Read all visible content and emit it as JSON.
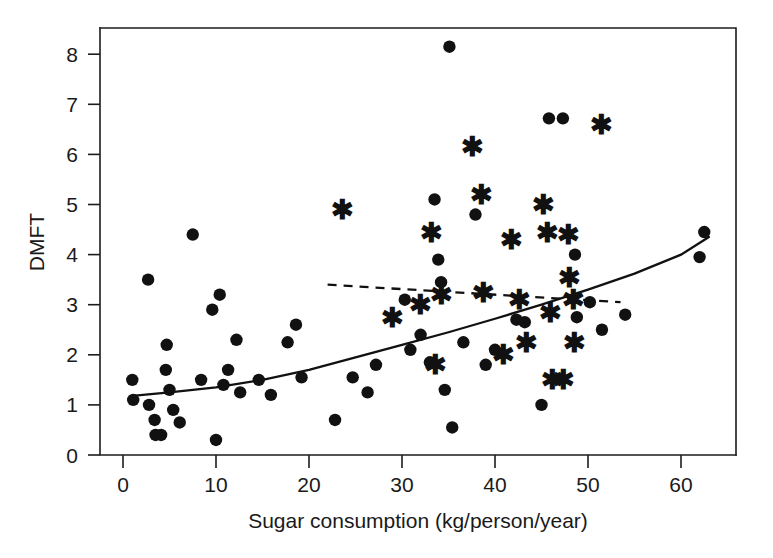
{
  "figure": {
    "title": "",
    "background_color": "#ffffff",
    "marker_color": "#111111",
    "axis_color": "#1c1c1c"
  },
  "chart_data": {
    "type": "scatter",
    "title": "",
    "subtitle": "",
    "xlabel": "Sugar consumption (kg/person/year)",
    "ylabel": "DMFT",
    "xlim": [
      -1.5,
      68
    ],
    "ylim": [
      -0.25,
      8.6
    ],
    "xticks": [
      0,
      10,
      20,
      30,
      40,
      50,
      60
    ],
    "xtick_labels": [
      "0",
      "10",
      "20",
      "30",
      "40",
      "50",
      "60"
    ],
    "yticks": [
      0,
      1,
      2,
      3,
      4,
      5,
      6,
      7,
      8
    ],
    "ytick_labels": [
      "0",
      "1",
      "2",
      "3",
      "4",
      "5",
      "6",
      "7",
      "8"
    ],
    "grid": false,
    "legend": null,
    "legend_position": "none",
    "series": [
      {
        "name": "circle-markers",
        "marker": "circle",
        "color": "#111111",
        "points": [
          [
            1.0,
            1.5
          ],
          [
            1.1,
            1.1
          ],
          [
            2.7,
            3.5
          ],
          [
            2.8,
            1.0
          ],
          [
            3.4,
            0.7
          ],
          [
            3.5,
            0.4
          ],
          [
            4.1,
            0.4
          ],
          [
            4.6,
            1.7
          ],
          [
            4.7,
            2.2
          ],
          [
            5.0,
            1.3
          ],
          [
            5.4,
            0.9
          ],
          [
            6.1,
            0.65
          ],
          [
            7.5,
            4.4
          ],
          [
            8.4,
            1.5
          ],
          [
            9.6,
            2.9
          ],
          [
            10.0,
            0.3
          ],
          [
            10.4,
            3.2
          ],
          [
            10.8,
            1.4
          ],
          [
            11.3,
            1.7
          ],
          [
            12.2,
            2.3
          ],
          [
            12.6,
            1.25
          ],
          [
            14.6,
            1.5
          ],
          [
            15.9,
            1.2
          ],
          [
            17.7,
            2.25
          ],
          [
            18.6,
            2.6
          ],
          [
            19.2,
            1.55
          ],
          [
            22.8,
            0.7
          ],
          [
            24.7,
            1.55
          ],
          [
            26.3,
            1.25
          ],
          [
            27.2,
            1.8
          ],
          [
            30.3,
            3.1
          ],
          [
            30.9,
            2.1
          ],
          [
            32.0,
            2.4
          ],
          [
            33.0,
            1.85
          ],
          [
            33.5,
            5.1
          ],
          [
            33.9,
            3.9
          ],
          [
            34.2,
            3.45
          ],
          [
            34.6,
            1.3
          ],
          [
            35.1,
            8.15
          ],
          [
            35.4,
            0.55
          ],
          [
            36.6,
            2.25
          ],
          [
            37.9,
            4.8
          ],
          [
            39.0,
            1.8
          ],
          [
            40.0,
            2.1
          ],
          [
            42.3,
            2.7
          ],
          [
            43.2,
            2.65
          ],
          [
            45.0,
            1.0
          ],
          [
            45.8,
            6.72
          ],
          [
            47.3,
            6.72
          ],
          [
            48.6,
            4.0
          ],
          [
            48.8,
            2.75
          ],
          [
            50.2,
            3.05
          ],
          [
            51.5,
            2.5
          ],
          [
            54.0,
            2.8
          ],
          [
            62.5,
            4.45
          ],
          [
            62.0,
            3.95
          ]
        ]
      },
      {
        "name": "star-markers",
        "marker": "star",
        "color": "#111111",
        "points": [
          [
            23.6,
            4.9
          ],
          [
            29.0,
            2.75
          ],
          [
            32.0,
            3.0
          ],
          [
            33.2,
            4.45
          ],
          [
            33.6,
            1.8
          ],
          [
            34.2,
            3.2
          ],
          [
            37.6,
            6.15
          ],
          [
            38.5,
            5.2
          ],
          [
            38.8,
            3.25
          ],
          [
            40.9,
            2.0
          ],
          [
            41.8,
            4.3
          ],
          [
            42.6,
            3.1
          ],
          [
            43.4,
            2.25
          ],
          [
            45.2,
            5.0
          ],
          [
            45.6,
            4.45
          ],
          [
            46.0,
            2.85
          ],
          [
            46.2,
            1.5
          ],
          [
            47.4,
            1.5
          ],
          [
            47.9,
            4.4
          ],
          [
            48.0,
            3.55
          ],
          [
            48.4,
            3.1
          ],
          [
            48.6,
            2.25
          ],
          [
            51.5,
            6.6
          ]
        ]
      }
    ],
    "fits": [
      {
        "name": "solid-trend-curve",
        "style": "solid",
        "color": "#111111",
        "points": [
          [
            1.0,
            1.18
          ],
          [
            5.0,
            1.25
          ],
          [
            10.0,
            1.35
          ],
          [
            15.0,
            1.5
          ],
          [
            20.0,
            1.7
          ],
          [
            25.0,
            1.95
          ],
          [
            30.0,
            2.2
          ],
          [
            35.0,
            2.45
          ],
          [
            40.0,
            2.72
          ],
          [
            45.0,
            3.0
          ],
          [
            50.0,
            3.3
          ],
          [
            55.0,
            3.62
          ],
          [
            60.0,
            4.0
          ],
          [
            63.0,
            4.35
          ]
        ]
      },
      {
        "name": "dashed-trend-line",
        "style": "dashed",
        "color": "#111111",
        "points": [
          [
            22.0,
            3.4
          ],
          [
            53.5,
            3.05
          ]
        ]
      }
    ]
  }
}
